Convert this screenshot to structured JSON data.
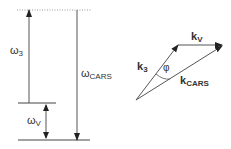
{
  "energy_diagram": {
    "omega3": {
      "symbol": "ω",
      "sub": "3"
    },
    "omegaCARS": {
      "symbol": "ω",
      "sub": "CARS"
    },
    "omegaV": {
      "symbol": "ω",
      "sub": "V"
    }
  },
  "vector_diagram": {
    "k3": {
      "symbol": "k",
      "sub": "3"
    },
    "kV": {
      "symbol": "k",
      "sub": "V"
    },
    "kCARS": {
      "symbol": "k",
      "sub": "CARS"
    },
    "angle": "φ"
  },
  "colors": {
    "line": "#444444",
    "dotted": "#999999"
  }
}
